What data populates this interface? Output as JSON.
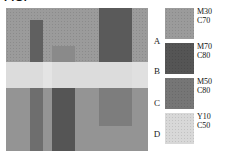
{
  "figure": {
    "cropped_caption": "FIG.",
    "panel_bg_color": "#9b9b9b",
    "light_band_color": "#dcdcdc"
  },
  "row_labels": [
    {
      "text": "A",
      "top": 36
    },
    {
      "text": "B",
      "top": 66
    },
    {
      "text": "C",
      "top": 98
    },
    {
      "text": "D",
      "top": 129
    }
  ],
  "legend": {
    "items": [
      {
        "swatch_color": "#9b9b9b",
        "line1": "M30",
        "line2": "C70",
        "top": 8
      },
      {
        "swatch_color": "#555555",
        "line1": "M70",
        "line2": "C80",
        "top": 43
      },
      {
        "swatch_color": "#767676",
        "line1": "M50",
        "line2": "C80",
        "top": 78
      },
      {
        "swatch_color": "#d8d8d8",
        "line1": "Y10",
        "line2": "C50",
        "top": 113
      }
    ]
  },
  "image_regions": {
    "background": {
      "color": "#9b9b9b"
    },
    "light_band": {
      "color": "#dcdcdc",
      "top": 54,
      "height": 26
    },
    "mid_band": {
      "color": "#949494",
      "top": 80,
      "height": 63
    },
    "bars": [
      {
        "name": "bar-1-dark-upper",
        "color": "#606060",
        "left": 24,
        "top": 12,
        "width": 13,
        "height": 62
      },
      {
        "name": "bar-1-dark-lower",
        "color": "#6e6e6e",
        "left": 24,
        "top": 80,
        "width": 13,
        "height": 63
      },
      {
        "name": "bar-2-mid-upper",
        "color": "#8a8a8a",
        "left": 46,
        "top": 38,
        "width": 23,
        "height": 36
      },
      {
        "name": "bar-2-dark-lower",
        "color": "#555555",
        "left": 46,
        "top": 80,
        "width": 23,
        "height": 63
      },
      {
        "name": "bar-3-dark-upper",
        "color": "#5a5a5a",
        "left": 93,
        "top": 0,
        "width": 33,
        "height": 54
      },
      {
        "name": "bar-3-mid-lower",
        "color": "#7d7d7d",
        "left": 93,
        "top": 80,
        "width": 33,
        "height": 38
      },
      {
        "name": "light-notch-left",
        "color": "#e4e4e4",
        "left": 37,
        "top": 54,
        "width": 9,
        "height": 26
      },
      {
        "name": "light-notch-right",
        "color": "#e0e0e0",
        "left": 126,
        "top": 54,
        "width": 16,
        "height": 26
      }
    ]
  }
}
